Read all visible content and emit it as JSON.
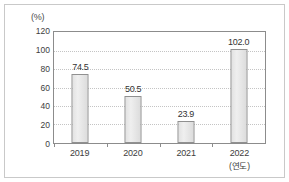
{
  "chart_data": {
    "type": "bar",
    "title": "",
    "subtitle": "",
    "xlabel": "(연도)",
    "ylabel": "(%)",
    "categories": [
      "2019",
      "2020",
      "2021",
      "2022"
    ],
    "values": [
      74.5,
      50.5,
      23.9,
      102.0
    ],
    "value_labels": [
      "74.5",
      "50.5",
      "23.9",
      "102.0"
    ],
    "ylim": [
      0,
      120
    ],
    "ytick_values": [
      0,
      20,
      40,
      60,
      80,
      100,
      120
    ],
    "ytick_labels": [
      "0",
      "20",
      "40",
      "60",
      "80",
      "100",
      "120"
    ],
    "grid": true,
    "grid_axis": "y",
    "grid_style": "dotted",
    "legend": false,
    "legend_position": "none",
    "bar_fill_color": "#e6e6e6",
    "bar_border_color": "#909090",
    "gridline_color": "#c4c4c4",
    "axis_color": "#8c8c8c",
    "frame_color": "#c9c9c9",
    "text_color": "#3d3d3d"
  },
  "axis": {
    "y_unit_label": "(%)",
    "x_unit_label": "(연도)"
  }
}
